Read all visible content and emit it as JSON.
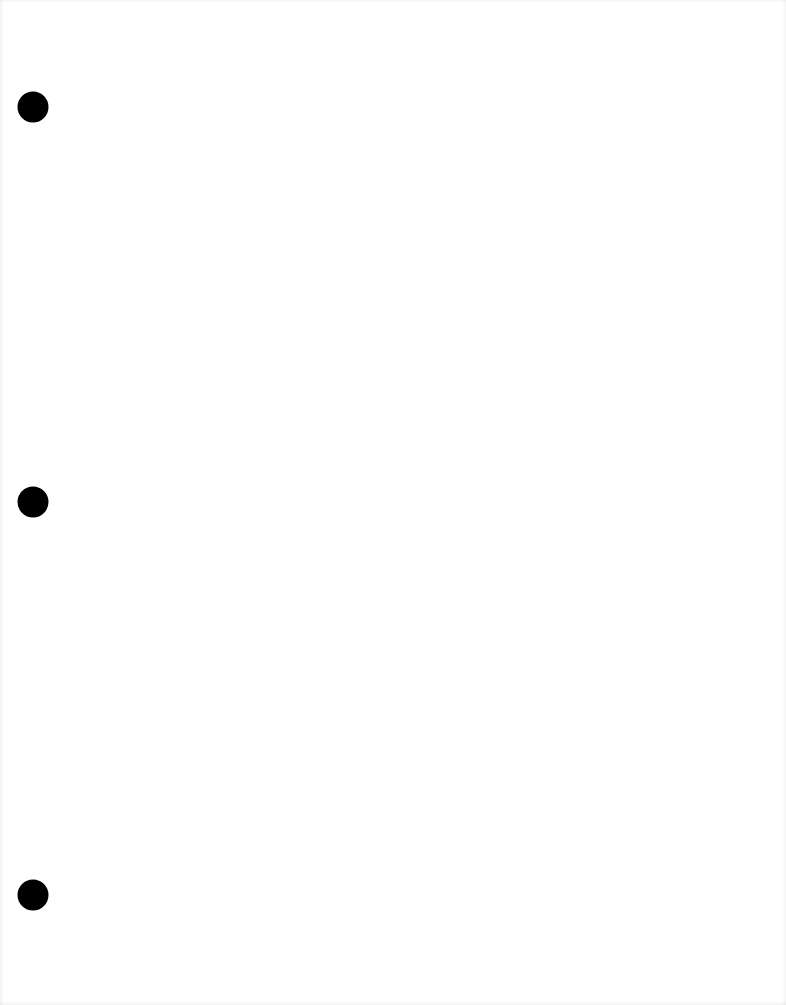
{
  "page": {
    "type": "blank three-hole-punched sheet",
    "background_color": "#ffffff",
    "width": 786,
    "height": 1005
  },
  "holes": [
    {
      "x": 33,
      "y": 107,
      "diameter": 31,
      "color": "#000000"
    },
    {
      "x": 33,
      "y": 502,
      "diameter": 31,
      "color": "#000000"
    },
    {
      "x": 33,
      "y": 895,
      "diameter": 31,
      "color": "#000000"
    }
  ]
}
